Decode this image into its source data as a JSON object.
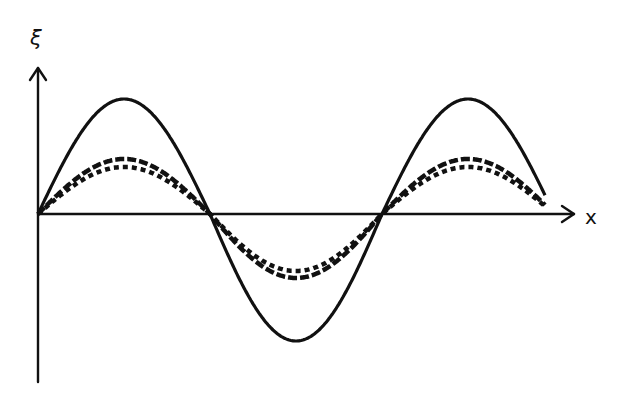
{
  "diagram": {
    "title": "",
    "axes": {
      "y_label": "ξ",
      "x_label": "x",
      "origin": [
        38,
        214
      ],
      "y_axis_top": 68,
      "y_axis_bottom": 382,
      "x_axis_right": 574,
      "color": "#111111"
    },
    "curves": [
      {
        "name": "solid",
        "style": "solid",
        "amplitude": 115,
        "amp_neg": 127,
        "x_start": 38,
        "x_end": 545,
        "zero_spacing": 172,
        "stroke_width": 3.2,
        "dash": ""
      },
      {
        "name": "dashed",
        "style": "dashed",
        "amplitude": 55,
        "amp_neg": 64,
        "x_start": 38,
        "x_end": 545,
        "zero_spacing": 172,
        "stroke_width": 4.5,
        "dash": "9,3"
      },
      {
        "name": "dotted",
        "style": "dotted",
        "amplitude": 47,
        "amp_neg": 57,
        "x_start": 38,
        "x_end": 545,
        "zero_spacing": 172,
        "stroke_width": 4.5,
        "dash": "5,4"
      }
    ]
  },
  "chart_data": {
    "type": "line",
    "title": "",
    "xlabel": "x",
    "ylabel": "ξ",
    "grid": false,
    "legend": "none",
    "series": [
      {
        "name": "solid (large amplitude)",
        "form": "sine",
        "relative_amplitude": 1.0
      },
      {
        "name": "dashed",
        "form": "sine",
        "relative_amplitude": 0.5
      },
      {
        "name": "dotted",
        "form": "sine",
        "relative_amplitude": 0.44
      }
    ],
    "zero_crossings_px": [
      38,
      208,
      387
    ],
    "period_px": 345
  }
}
